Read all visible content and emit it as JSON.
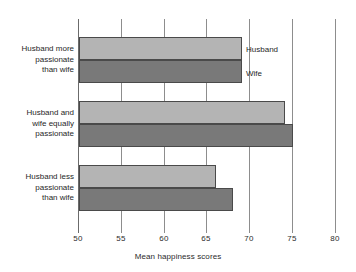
{
  "chart_data": {
    "type": "bar",
    "orientation": "horizontal",
    "title": "",
    "xlabel": "Mean happiness scores",
    "ylabel": "",
    "xlim": [
      50,
      80
    ],
    "xticks": [
      50,
      55,
      60,
      65,
      70,
      75,
      80
    ],
    "xtick_labels": [
      "50",
      "55",
      "60",
      "65",
      "70",
      "75",
      "80"
    ],
    "grid": true,
    "grid_axis": "x",
    "legend_position": "inside-plot-right-of-first-group",
    "categories": [
      "Husband more\npassionate\nthan wife",
      "Husband and\nwife equally\npassionate",
      "Husband less\npassionate\nthan wife"
    ],
    "series": [
      {
        "name": "Husband",
        "color": "#b4b4b4",
        "values": [
          69,
          74,
          66
        ]
      },
      {
        "name": "Wife",
        "color": "#797979",
        "values": [
          69,
          75,
          68
        ]
      }
    ]
  },
  "legend": {
    "husband": "Husband",
    "wife": "Wife"
  },
  "axis": {
    "title": "Mean happiness scores"
  }
}
